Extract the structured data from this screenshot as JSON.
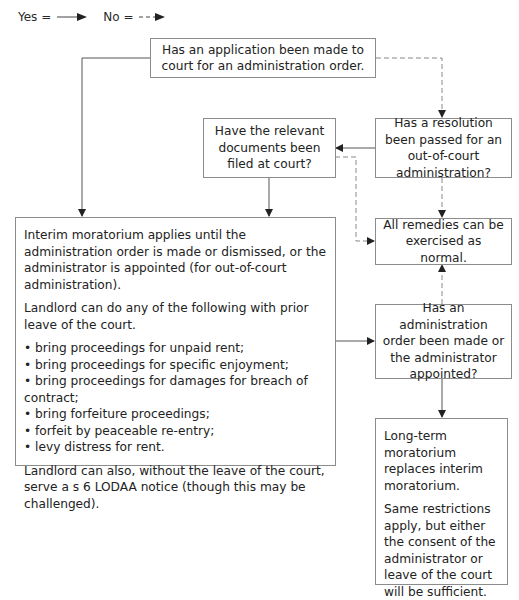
{
  "legend": {
    "yes_label": "Yes =",
    "no_label": "No =",
    "yes_style": "solid-arrow",
    "no_style": "dashed-arrow"
  },
  "nodes": {
    "application": {
      "text": "Has an application been made to court for an administration order."
    },
    "documents": {
      "text": "Have the relevant documents been filed at court?"
    },
    "resolution": {
      "text": "Has a resolution been passed for an out-of-court administration?"
    },
    "interim": {
      "para1": "Interim moratorium applies until the administration order is made or dismissed, or the administrator is appointed (for out-of-court administration).",
      "para2": "Landlord can do any of the following with prior leave of the court.",
      "bullets": [
        "bring proceedings for unpaid rent;",
        "bring proceedings for specific enjoyment;",
        "bring proceedings for damages for breach of contract;",
        "bring forfeiture proceedings;",
        "forfeit by peaceable re-entry;",
        "levy distress for rent."
      ],
      "para3": "Landlord can also, without the leave of the court, serve a s 6 LODAA notice (though this may be challenged)."
    },
    "remedies": {
      "text": "All remedies can be exercised as normal."
    },
    "admin_order": {
      "text": "Has an administration order been made or the administrator appointed?"
    },
    "long_term": {
      "para1": "Long-term moratorium replaces interim moratorium.",
      "para2": "Same restrictions apply, but either the consent of the administrator or leave of the court will be sufficient."
    }
  },
  "edges": [
    {
      "from": "application",
      "to": "interim",
      "type": "yes"
    },
    {
      "from": "application",
      "to": "resolution",
      "type": "no"
    },
    {
      "from": "resolution",
      "to": "documents",
      "type": "yes"
    },
    {
      "from": "resolution",
      "to": "remedies",
      "type": "no"
    },
    {
      "from": "documents",
      "to": "interim",
      "type": "yes"
    },
    {
      "from": "documents",
      "to": "remedies",
      "type": "no"
    },
    {
      "from": "interim",
      "to": "admin_order",
      "type": "yes"
    },
    {
      "from": "admin_order",
      "to": "remedies",
      "type": "no"
    },
    {
      "from": "admin_order",
      "to": "long_term",
      "type": "yes"
    }
  ],
  "colors": {
    "line": "#555555",
    "box_border": "#8c8c8c",
    "text": "#222222"
  }
}
